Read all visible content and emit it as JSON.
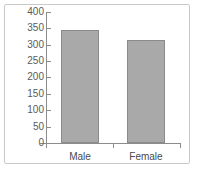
{
  "chart_data": {
    "type": "bar",
    "title": "",
    "subtitle": "",
    "xlabel": "",
    "ylabel": "",
    "categories": [
      "Male",
      "Female"
    ],
    "values": [
      345,
      315
    ],
    "series": [
      {
        "name": "count",
        "values": [
          345,
          315
        ]
      }
    ],
    "ylim": [
      0,
      400
    ],
    "yticks": [
      0,
      50,
      100,
      150,
      200,
      250,
      300,
      350,
      400
    ],
    "ytick_labels": [
      "0",
      "50",
      "100",
      "150",
      "200",
      "250",
      "300",
      "350",
      "400"
    ],
    "grid": false,
    "legend": false,
    "legend_position": "none",
    "bar_color": "#a9a9a9",
    "bar_edge_color": "#8a8a8a",
    "axis_color": "#8c8c8c",
    "text_color": "#5a5a5a",
    "frame_border_color": "#c9c9c9",
    "background_color": "#ffffff"
  },
  "axis": {
    "tick_400": "400",
    "tick_350": "350",
    "tick_300": "300",
    "tick_250": "250",
    "tick_200": "200",
    "tick_150": "150",
    "tick_100": "100",
    "tick_50": "50",
    "tick_0": "0"
  },
  "categories": {
    "male": "Male",
    "female": "Female"
  }
}
